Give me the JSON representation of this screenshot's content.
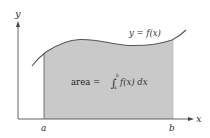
{
  "diagram": {
    "axes": {
      "x_label": "x",
      "y_label": "y"
    },
    "curve": {
      "label": "y = f(x)"
    },
    "bounds": {
      "lower": "a",
      "upper": "b"
    },
    "area": {
      "prefix": "area = ",
      "integral_sign": "∫",
      "upper_limit": "b",
      "lower_limit": "a",
      "integrand": "f(x) dx"
    },
    "colors": {
      "shade": "#c9c9c9",
      "curve": "#555555",
      "axis": "#555555",
      "background": "#ffffff"
    }
  }
}
